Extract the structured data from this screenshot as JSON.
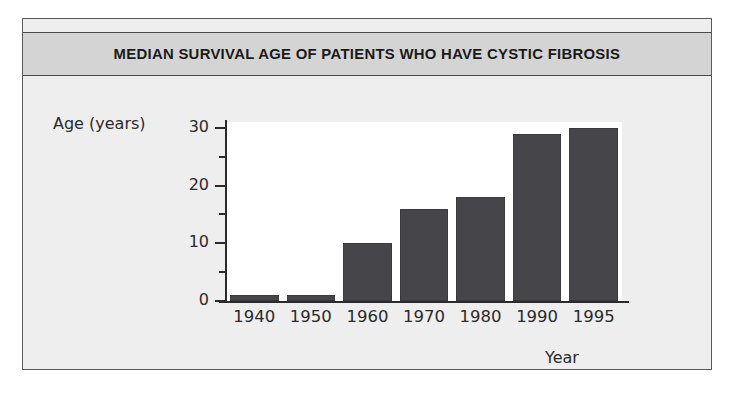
{
  "figure": {
    "title": "MEDIAN SURVIVAL AGE OF PATIENTS WHO HAVE CYSTIC FIBROSIS",
    "title_band_color": "#d4d4d4",
    "panel_color": "#eeeeee",
    "plot_background": "#ffffff",
    "bar_color": "#46464a",
    "axis_color": "#2b2b2b"
  },
  "chart_data": {
    "type": "bar",
    "title": "MEDIAN SURVIVAL AGE OF PATIENTS WHO HAVE CYSTIC FIBROSIS",
    "subtitle": "",
    "xlabel": "Year",
    "ylabel": "Age (years)",
    "categories": [
      "1940",
      "1950",
      "1960",
      "1970",
      "1980",
      "1990",
      "1995"
    ],
    "values": [
      1,
      1,
      10,
      16,
      18,
      29,
      30
    ],
    "series": [
      {
        "name": "Median survival age",
        "values": [
          1,
          1,
          10,
          16,
          18,
          29,
          30
        ]
      }
    ],
    "ylim": [
      0,
      31
    ],
    "yticks": [
      0,
      10,
      20,
      30
    ],
    "ytick_labels": [
      "0",
      "10",
      "20",
      "30"
    ],
    "yminor_ticks": [
      5,
      15,
      25
    ],
    "grid": false,
    "legend": false,
    "legend_position": "none",
    "annotations": []
  }
}
